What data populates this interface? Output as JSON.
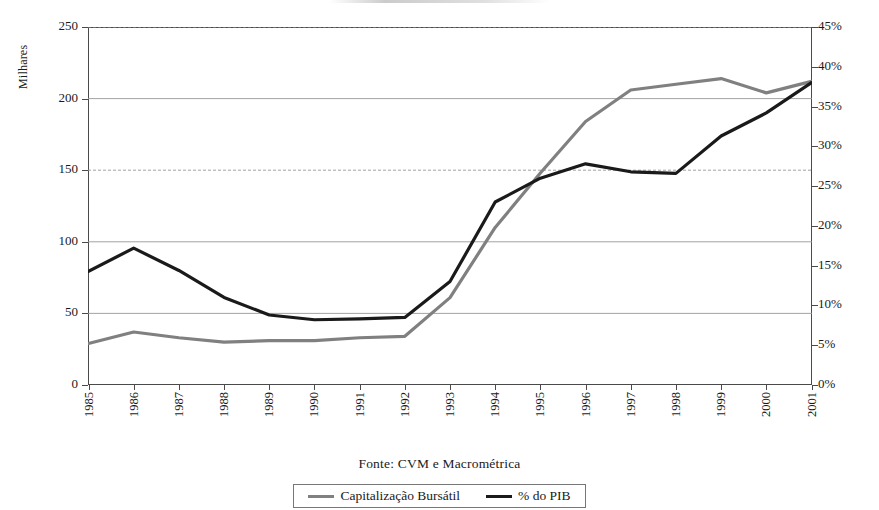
{
  "axes": {
    "y_left_title": "Milhares",
    "y_left_ticks": [
      "250",
      "200",
      "150",
      "100",
      "50",
      "0"
    ],
    "y_right_ticks": [
      "45%",
      "40%",
      "35%",
      "30%",
      "25%",
      "20%",
      "15%",
      "10%",
      "5%",
      "0%"
    ],
    "x_ticks": [
      "1985",
      "1986",
      "1987",
      "1988",
      "1989",
      "1990",
      "1991",
      "1992",
      "1993",
      "1994",
      "1995",
      "1996",
      "1997",
      "1998",
      "1999",
      "2000",
      "2001"
    ]
  },
  "source_note": "Fonte: CVM e Macrométrica",
  "legend": {
    "items": [
      {
        "label": "Capitalização Bursátil",
        "color": "#808080"
      },
      {
        "label": "% do PIB",
        "color": "#1a1a1a"
      }
    ]
  },
  "colors": {
    "series_capitalizacao": "#808080",
    "series_pib": "#1a1a1a",
    "axis": "#4a4a4a",
    "gridline": "#999999",
    "background": "#ffffff"
  },
  "chart_data": {
    "type": "line",
    "title": "",
    "xlabel": "",
    "ylabel": "Milhares",
    "y2label": "",
    "x": [
      "1985",
      "1986",
      "1987",
      "1988",
      "1989",
      "1990",
      "1991",
      "1992",
      "1993",
      "1994",
      "1995",
      "1996",
      "1997",
      "1998",
      "1999",
      "2000",
      "2001"
    ],
    "ylim": [
      0,
      250
    ],
    "y2lim": [
      0,
      45
    ],
    "yticks": [
      0,
      50,
      100,
      150,
      200,
      250
    ],
    "y2ticks": [
      0,
      5,
      10,
      15,
      20,
      25,
      30,
      35,
      40,
      45
    ],
    "grid": true,
    "legend_position": "bottom",
    "series": [
      {
        "name": "Capitalização Bursátil",
        "axis": "left",
        "unit": "Milhares",
        "color": "#808080",
        "values": [
          29,
          37,
          33,
          30,
          31,
          31,
          33,
          34,
          61,
          110,
          148,
          184,
          206,
          210,
          214,
          204,
          212
        ]
      },
      {
        "name": "% do PIB",
        "axis": "right",
        "unit": "%",
        "color": "#1a1a1a",
        "values": [
          14.3,
          17.2,
          14.4,
          11.0,
          8.8,
          8.2,
          8.3,
          8.5,
          13.0,
          23.0,
          26.0,
          27.8,
          26.8,
          26.6,
          31.3,
          34.2,
          38.0
        ]
      }
    ]
  }
}
